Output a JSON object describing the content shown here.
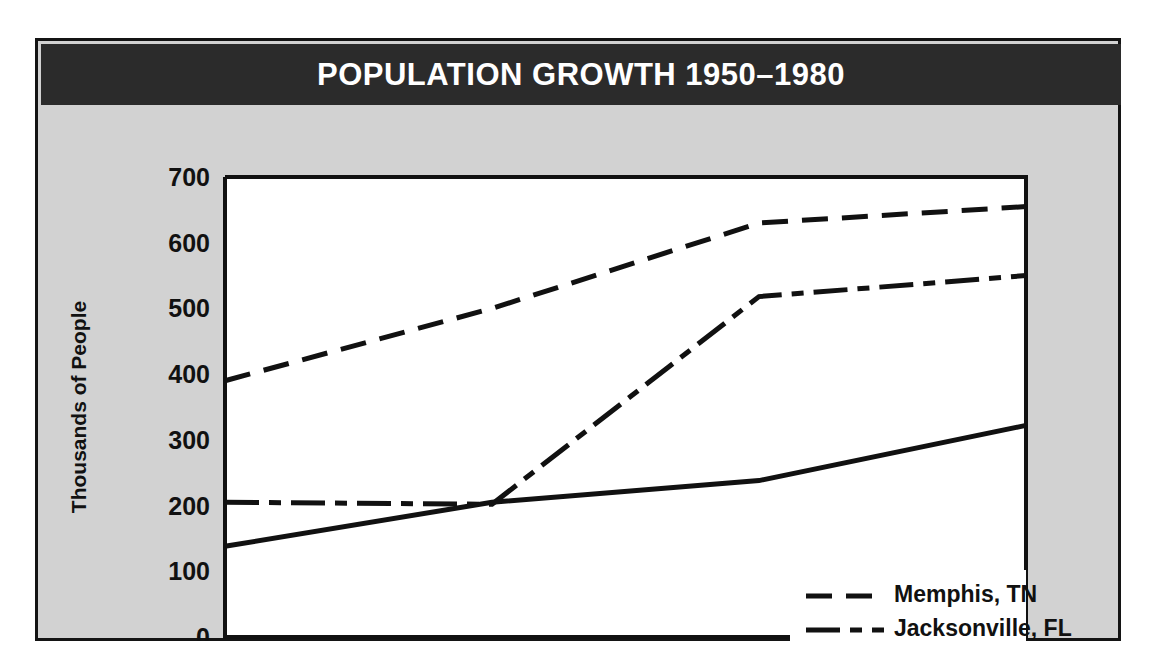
{
  "chart_data": {
    "type": "line",
    "title": "POPULATION GROWTH 1950–1980",
    "xlabel": "",
    "ylabel": "Thousands of People",
    "x": [
      1950,
      1960,
      1970,
      1980
    ],
    "xticklabels": [
      "1950",
      "1960",
      "1970",
      "1980"
    ],
    "yticks": [
      0,
      100,
      200,
      300,
      400,
      500,
      600,
      700
    ],
    "yticklabels": [
      "0",
      "100",
      "200",
      "300",
      "400",
      "500",
      "600",
      "700"
    ],
    "ylim": [
      0,
      700
    ],
    "xlim": [
      1950,
      1980
    ],
    "grid": false,
    "legend_position": "lower right",
    "series": [
      {
        "name": "Memphis, TN",
        "values": [
          390,
          500,
          630,
          655
        ],
        "style": "dashed",
        "dasharray": "26 14"
      },
      {
        "name": "Jacksonville, FL",
        "values": [
          205,
          202,
          518,
          550
        ],
        "style": "dash-dot",
        "dasharray": "34 10 12 10"
      },
      {
        "name": "Charlotte, NC",
        "values": [
          138,
          205,
          238,
          322
        ],
        "style": "solid",
        "dasharray": "none"
      }
    ]
  },
  "figure": {
    "background_color": "#d2d2d2",
    "border_color": "#141414",
    "title_band_color": "#2b2b2b",
    "title_text_color": "#ffffff",
    "plot_background_color": "#ffffff",
    "line_color": "#111111"
  }
}
